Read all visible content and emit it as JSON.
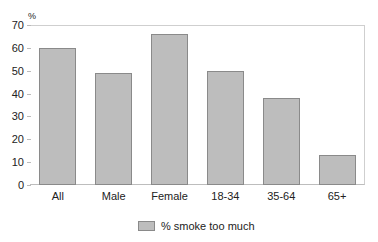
{
  "chart_data": {
    "type": "bar",
    "title": "",
    "xlabel": "",
    "ylabel": "%",
    "ylim": [
      0,
      70
    ],
    "yticks": [
      0,
      10,
      20,
      30,
      40,
      50,
      60,
      70
    ],
    "categories": [
      "All",
      "Male",
      "Female",
      "18-34",
      "35-64",
      "65+"
    ],
    "series": [
      {
        "name": "% smoke too much",
        "values": [
          60,
          49,
          66,
          50,
          38,
          13
        ],
        "color": "#bdbdbd"
      }
    ],
    "grid": false,
    "legend_position": "bottom"
  },
  "yaxis": {
    "unit": "%",
    "ticks": [
      "0",
      "10",
      "20",
      "30",
      "40",
      "50",
      "60",
      "70"
    ]
  },
  "xaxis": {
    "labels": [
      "All",
      "Male",
      "Female",
      "18-34",
      "35-64",
      "65+"
    ]
  },
  "legend": {
    "label": "% smoke too much"
  }
}
